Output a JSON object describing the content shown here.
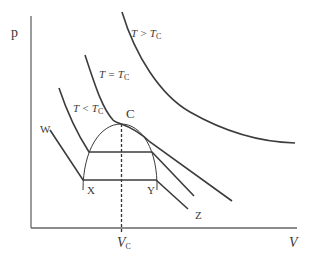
{
  "diagram": {
    "axes": {
      "y_label": "p",
      "x_label": "V",
      "x_tick_label": "V",
      "x_tick_sub": "C"
    },
    "isotherms": [
      {
        "id": "above",
        "label_T": "T",
        "label_rel": " > T",
        "label_sub": "C"
      },
      {
        "id": "critical",
        "label_T": "T",
        "label_rel": " = T",
        "label_sub": "C"
      },
      {
        "id": "below",
        "label_T": "T",
        "label_rel": " < T",
        "label_sub": "C"
      }
    ],
    "points": {
      "critical_point": "C",
      "w": "W",
      "x": "X",
      "y": "Y",
      "z": "Z"
    },
    "colors": {
      "line": "#3c3c3c",
      "background": "#ffffff"
    }
  }
}
